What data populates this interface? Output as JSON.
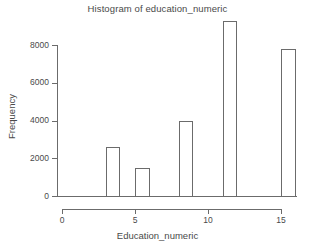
{
  "chart_data": {
    "type": "bar",
    "title": "Histogram of education_numeric",
    "xlabel": "Education_numeric",
    "ylabel": "Frequency",
    "grid": false,
    "legend": null,
    "xlim": [
      0,
      16
    ],
    "ylim": [
      0,
      9300
    ],
    "x_ticks": [
      {
        "value": 0,
        "label": "0"
      },
      {
        "value": 5,
        "label": "5"
      },
      {
        "value": 10,
        "label": "10"
      },
      {
        "value": 15,
        "label": "15"
      }
    ],
    "y_ticks": [
      {
        "value": 0,
        "label": "0"
      },
      {
        "value": 2000,
        "label": "2000"
      },
      {
        "value": 4000,
        "label": "4000"
      },
      {
        "value": 6000,
        "label": "6000"
      },
      {
        "value": 8000,
        "label": "8000"
      }
    ],
    "bins": [
      {
        "bin_start": 3,
        "bin_end": 4,
        "center": 3.5,
        "value": 2600
      },
      {
        "bin_start": 5,
        "bin_end": 6,
        "center": 5.5,
        "value": 1470
      },
      {
        "bin_start": 8,
        "bin_end": 9,
        "center": 8.5,
        "value": 3950
      },
      {
        "bin_start": 11,
        "bin_end": 12,
        "center": 11.5,
        "value": 9250
      },
      {
        "bin_start": 15,
        "bin_end": 16,
        "center": 15.5,
        "value": 7800
      }
    ],
    "categories": [
      "3-4",
      "5-6",
      "8-9",
      "11-12",
      "15-16"
    ],
    "values": [
      2600,
      1470,
      3950,
      9250,
      7800
    ],
    "colors": {
      "bar_outline": "#6b6b6b",
      "bar_fill": "transparent",
      "axis": "#6b6b6b",
      "text": "#4a4a4a",
      "background": "#ffffff"
    }
  }
}
